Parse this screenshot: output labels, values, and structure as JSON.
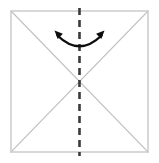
{
  "figure": {
    "type": "origami-fold-diagram",
    "canvas": {
      "width": 159,
      "height": 163,
      "background": "#ffffff"
    }
  },
  "colors": {
    "paper_outline": "#c8c8c8",
    "crease_diagonal": "#c0c0c0",
    "fold_line_dashed": "#3a3a3a",
    "arrow": "#0d0d0d",
    "background": "#ffffff"
  },
  "shapes": {
    "square": {
      "name": "paper-square",
      "x": 11,
      "y": 11,
      "width": 137,
      "height": 141,
      "stroke_width": 1.4
    },
    "diagonal_1": {
      "name": "crease-diagonal-tl-br",
      "x1": 11,
      "y1": 11,
      "x2": 148,
      "y2": 152,
      "stroke_width": 1.2
    },
    "diagonal_2": {
      "name": "crease-diagonal-tr-bl",
      "x1": 148,
      "y1": 11,
      "x2": 11,
      "y2": 152,
      "stroke_width": 1.2
    },
    "fold_line": {
      "name": "vertical-fold-line",
      "x": 79.5,
      "y1": 8,
      "y2": 156,
      "stroke_width": 2.6,
      "dash": "7 5"
    },
    "center_point": {
      "x": 79.5,
      "y": 81.5
    }
  },
  "arrow": {
    "name": "double-headed-fold-arrow",
    "path": "M 57.5 35.5 Q 79.5 57 101.5 35.5",
    "stroke_width": 2.4,
    "head_size": 9,
    "left_head": {
      "tip_x": 54.5,
      "tip_y": 30.5,
      "angle_deg": -135
    },
    "right_head": {
      "tip_x": 104.5,
      "tip_y": 30.5,
      "angle_deg": -45
    },
    "direction": "bidirectional",
    "curvature": "concave-up"
  }
}
